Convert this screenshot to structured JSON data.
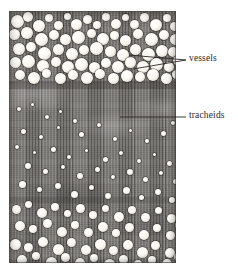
{
  "figure": {
    "kind": "light-micrograph",
    "background_color": "#ffffff",
    "plate": {
      "left": 9,
      "top": 11,
      "width": 167,
      "height": 252,
      "base_color": "#7c7a76",
      "border_color": "#46423e"
    }
  },
  "annotations": [
    {
      "id": "vessels",
      "label": "vessels",
      "text_color": "#2b2723",
      "label_x": 189,
      "label_y": 53,
      "leader_style": "two-line-fan",
      "leaders": [
        {
          "x1": 186,
          "y1": 60,
          "x2": 129,
          "y2": 55
        },
        {
          "x1": 186,
          "y1": 60,
          "x2": 133,
          "y2": 69
        }
      ]
    },
    {
      "id": "tracheids",
      "label": "tracheids",
      "text_color": "#2b2723",
      "label_x": 189,
      "label_y": 110,
      "leader_style": "single-horizontal",
      "leaders": [
        {
          "x1": 186,
          "y1": 117,
          "x2": 120,
          "y2": 117
        }
      ]
    }
  ],
  "zones": [
    {
      "name": "upper-vessel-band",
      "description": "dense band of large round vessel pores",
      "top": 0,
      "height": 72
    },
    {
      "name": "tracheid-band",
      "description": "finely striated tracheid fibres with pale wandering parenchyma bands",
      "top": 72,
      "height": 110
    },
    {
      "name": "lower-vessel-zone",
      "description": "scattered vessel pores of varied size in striated ground tissue",
      "top": 182,
      "height": 70
    }
  ],
  "pores": {
    "upper": [
      [
        2,
        4,
        13,
        13
      ],
      [
        14,
        1,
        10,
        10
      ],
      [
        24,
        9,
        12,
        12
      ],
      [
        36,
        3,
        8,
        8
      ],
      [
        45,
        10,
        9,
        9
      ],
      [
        55,
        2,
        7,
        7
      ],
      [
        62,
        8,
        11,
        11
      ],
      [
        74,
        4,
        9,
        9
      ],
      [
        84,
        10,
        8,
        8
      ],
      [
        93,
        2,
        8,
        8
      ],
      [
        102,
        8,
        10,
        10
      ],
      [
        113,
        3,
        7,
        7
      ],
      [
        121,
        9,
        9,
        9
      ],
      [
        131,
        2,
        9,
        9
      ],
      [
        141,
        8,
        12,
        12
      ],
      [
        154,
        3,
        8,
        8
      ],
      [
        161,
        11,
        9,
        9
      ],
      [
        0,
        18,
        11,
        11
      ],
      [
        12,
        16,
        12,
        12
      ],
      [
        26,
        22,
        13,
        13
      ],
      [
        40,
        19,
        10,
        10
      ],
      [
        51,
        23,
        11,
        11
      ],
      [
        63,
        20,
        13,
        13
      ],
      [
        78,
        18,
        9,
        9
      ],
      [
        88,
        22,
        12,
        12
      ],
      [
        101,
        20,
        9,
        9
      ],
      [
        111,
        24,
        11,
        11
      ],
      [
        124,
        18,
        10,
        10
      ],
      [
        136,
        22,
        13,
        13
      ],
      [
        150,
        19,
        10,
        10
      ],
      [
        161,
        23,
        11,
        11
      ],
      [
        4,
        32,
        12,
        12
      ],
      [
        17,
        31,
        10,
        10
      ],
      [
        29,
        36,
        13,
        13
      ],
      [
        44,
        33,
        11,
        11
      ],
      [
        57,
        37,
        12,
        12
      ],
      [
        70,
        34,
        10,
        10
      ],
      [
        81,
        31,
        13,
        13
      ],
      [
        96,
        35,
        11,
        11
      ],
      [
        108,
        38,
        12,
        12
      ],
      [
        121,
        33,
        11,
        11
      ],
      [
        133,
        37,
        13,
        13
      ],
      [
        147,
        34,
        12,
        12
      ],
      [
        159,
        36,
        10,
        10
      ],
      [
        1,
        46,
        11,
        11
      ],
      [
        13,
        44,
        13,
        13
      ],
      [
        28,
        49,
        12,
        12
      ],
      [
        42,
        46,
        10,
        10
      ],
      [
        53,
        50,
        12,
        12
      ],
      [
        66,
        47,
        13,
        13
      ],
      [
        80,
        51,
        11,
        11
      ],
      [
        92,
        47,
        10,
        10
      ],
      [
        103,
        50,
        12,
        12
      ],
      [
        116,
        46,
        11,
        11
      ],
      [
        128,
        50,
        12,
        12
      ],
      [
        141,
        47,
        13,
        13
      ],
      [
        155,
        51,
        10,
        10
      ],
      [
        164,
        45,
        9,
        9
      ],
      [
        6,
        59,
        10,
        10
      ],
      [
        19,
        61,
        12,
        12
      ],
      [
        33,
        58,
        9,
        9
      ],
      [
        46,
        62,
        11,
        11
      ],
      [
        59,
        59,
        10,
        10
      ],
      [
        72,
        61,
        12,
        12
      ],
      [
        86,
        58,
        10,
        10
      ],
      [
        99,
        62,
        11,
        11
      ],
      [
        112,
        59,
        12,
        12
      ],
      [
        126,
        61,
        10,
        10
      ],
      [
        138,
        58,
        12,
        12
      ],
      [
        152,
        62,
        11,
        11
      ],
      [
        163,
        59,
        9,
        9
      ]
    ],
    "middle": [
      [
        8,
        96,
        4,
        4
      ],
      [
        22,
        92,
        3,
        3
      ],
      [
        36,
        104,
        4,
        4
      ],
      [
        50,
        99,
        3,
        3
      ],
      [
        64,
        108,
        4,
        4
      ],
      [
        12,
        118,
        5,
        5
      ],
      [
        30,
        124,
        4,
        4
      ],
      [
        48,
        115,
        3,
        3
      ],
      [
        70,
        121,
        5,
        5
      ],
      [
        88,
        112,
        4,
        4
      ],
      [
        104,
        126,
        4,
        4
      ],
      [
        120,
        118,
        3,
        3
      ],
      [
        136,
        128,
        4,
        4
      ],
      [
        152,
        120,
        5,
        5
      ],
      [
        162,
        110,
        4,
        4
      ],
      [
        6,
        134,
        4,
        4
      ],
      [
        24,
        140,
        3,
        3
      ],
      [
        42,
        136,
        5,
        5
      ],
      [
        58,
        144,
        4,
        4
      ],
      [
        76,
        138,
        3,
        3
      ],
      [
        94,
        146,
        5,
        5
      ],
      [
        110,
        140,
        4,
        4
      ],
      [
        128,
        148,
        4,
        4
      ],
      [
        144,
        142,
        3,
        3
      ],
      [
        158,
        150,
        5,
        5
      ],
      [
        16,
        152,
        6,
        6
      ],
      [
        34,
        158,
        5,
        5
      ],
      [
        52,
        154,
        4,
        4
      ],
      [
        68,
        162,
        6,
        6
      ],
      [
        86,
        156,
        5,
        5
      ],
      [
        102,
        164,
        4,
        4
      ],
      [
        118,
        158,
        6,
        6
      ],
      [
        134,
        166,
        5,
        5
      ],
      [
        150,
        160,
        4,
        4
      ],
      [
        164,
        168,
        5,
        5
      ],
      [
        10,
        170,
        7,
        7
      ],
      [
        28,
        176,
        5,
        5
      ],
      [
        46,
        172,
        6,
        6
      ],
      [
        62,
        180,
        7,
        7
      ],
      [
        80,
        174,
        5,
        5
      ],
      [
        96,
        182,
        6,
        6
      ],
      [
        114,
        176,
        7,
        7
      ],
      [
        130,
        184,
        5,
        5
      ],
      [
        146,
        178,
        6,
        6
      ],
      [
        160,
        186,
        6,
        6
      ]
    ],
    "lower": [
      [
        3,
        194,
        9,
        9
      ],
      [
        16,
        190,
        7,
        7
      ],
      [
        28,
        197,
        10,
        10
      ],
      [
        42,
        192,
        8,
        8
      ],
      [
        55,
        199,
        7,
        7
      ],
      [
        67,
        193,
        9,
        9
      ],
      [
        80,
        200,
        8,
        8
      ],
      [
        93,
        194,
        7,
        7
      ],
      [
        105,
        201,
        10,
        10
      ],
      [
        119,
        195,
        8,
        8
      ],
      [
        132,
        202,
        9,
        9
      ],
      [
        146,
        196,
        7,
        7
      ],
      [
        158,
        203,
        9,
        9
      ],
      [
        6,
        210,
        10,
        10
      ],
      [
        20,
        214,
        8,
        8
      ],
      [
        34,
        208,
        9,
        9
      ],
      [
        48,
        216,
        10,
        10
      ],
      [
        62,
        210,
        8,
        8
      ],
      [
        75,
        217,
        9,
        9
      ],
      [
        89,
        211,
        10,
        10
      ],
      [
        103,
        218,
        8,
        8
      ],
      [
        116,
        212,
        9,
        9
      ],
      [
        130,
        219,
        10,
        10
      ],
      [
        144,
        213,
        8,
        8
      ],
      [
        157,
        220,
        9,
        9
      ],
      [
        166,
        211,
        7,
        7
      ],
      [
        1,
        228,
        11,
        11
      ],
      [
        15,
        232,
        9,
        9
      ],
      [
        29,
        226,
        10,
        10
      ],
      [
        44,
        233,
        11,
        11
      ],
      [
        58,
        227,
        9,
        9
      ],
      [
        72,
        234,
        10,
        10
      ],
      [
        86,
        228,
        11,
        11
      ],
      [
        100,
        235,
        9,
        9
      ],
      [
        114,
        229,
        10,
        10
      ],
      [
        128,
        236,
        11,
        11
      ],
      [
        142,
        230,
        9,
        9
      ],
      [
        156,
        237,
        10,
        10
      ],
      [
        8,
        244,
        10,
        10
      ],
      [
        23,
        241,
        8,
        8
      ],
      [
        37,
        246,
        11,
        11
      ],
      [
        52,
        242,
        9,
        9
      ],
      [
        66,
        247,
        10,
        10
      ],
      [
        81,
        243,
        8,
        8
      ],
      [
        95,
        248,
        11,
        11
      ],
      [
        110,
        244,
        9,
        9
      ],
      [
        124,
        249,
        10,
        10
      ],
      [
        139,
        245,
        8,
        8
      ],
      [
        153,
        248,
        10,
        10
      ],
      [
        165,
        242,
        8,
        8
      ]
    ]
  }
}
